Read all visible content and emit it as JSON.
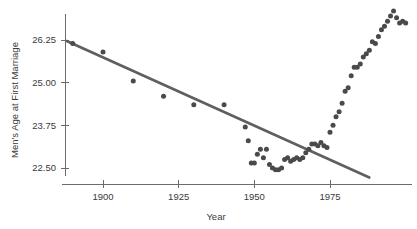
{
  "chart_data": {
    "type": "scatter",
    "title": "",
    "xlabel": "Year",
    "ylabel": "Men's Age at First Marriage",
    "xlim": [
      1885,
      2002
    ],
    "ylim": [
      22.1,
      27.2
    ],
    "grid": false,
    "legend": "none",
    "xticks": [
      1900,
      1925,
      1950,
      1975
    ],
    "xtick_labels": [
      "1900",
      "1925",
      "1950",
      "1975"
    ],
    "yticks": [
      22.5,
      23.75,
      25.0,
      26.25
    ],
    "ytick_labels": [
      "22.50",
      "23.75",
      "25.00",
      "26.25"
    ],
    "series": [
      {
        "name": "Men's median age at first marriage",
        "marker": "circle",
        "color": "#4a4a4a",
        "points": [
          [
            1890,
            26.15
          ],
          [
            1900,
            25.9
          ],
          [
            1910,
            25.05
          ],
          [
            1920,
            24.6
          ],
          [
            1930,
            24.35
          ],
          [
            1940,
            24.35
          ],
          [
            1947,
            23.7
          ],
          [
            1948,
            23.3
          ],
          [
            1949,
            22.65
          ],
          [
            1950,
            22.65
          ],
          [
            1951,
            22.9
          ],
          [
            1952,
            23.05
          ],
          [
            1953,
            22.8
          ],
          [
            1954,
            23.05
          ],
          [
            1955,
            22.6
          ],
          [
            1956,
            22.5
          ],
          [
            1957,
            22.45
          ],
          [
            1958,
            22.45
          ],
          [
            1959,
            22.5
          ],
          [
            1960,
            22.75
          ],
          [
            1961,
            22.8
          ],
          [
            1962,
            22.7
          ],
          [
            1963,
            22.75
          ],
          [
            1964,
            22.8
          ],
          [
            1965,
            22.75
          ],
          [
            1966,
            22.8
          ],
          [
            1967,
            22.95
          ],
          [
            1968,
            23.05
          ],
          [
            1969,
            23.2
          ],
          [
            1970,
            23.2
          ],
          [
            1971,
            23.15
          ],
          [
            1972,
            23.25
          ],
          [
            1973,
            23.15
          ],
          [
            1974,
            23.1
          ],
          [
            1975,
            23.55
          ],
          [
            1976,
            23.75
          ],
          [
            1977,
            24.0
          ],
          [
            1978,
            24.15
          ],
          [
            1979,
            24.4
          ],
          [
            1980,
            24.75
          ],
          [
            1981,
            24.85
          ],
          [
            1982,
            25.2
          ],
          [
            1983,
            25.45
          ],
          [
            1984,
            25.45
          ],
          [
            1985,
            25.55
          ],
          [
            1986,
            25.75
          ],
          [
            1987,
            25.85
          ],
          [
            1988,
            25.95
          ],
          [
            1989,
            26.2
          ],
          [
            1990,
            26.15
          ],
          [
            1991,
            26.35
          ],
          [
            1992,
            26.55
          ],
          [
            1993,
            26.65
          ],
          [
            1994,
            26.8
          ],
          [
            1995,
            26.95
          ],
          [
            1996,
            27.1
          ],
          [
            1997,
            26.9
          ],
          [
            1998,
            26.75
          ],
          [
            1999,
            26.8
          ],
          [
            2000,
            26.75
          ]
        ]
      }
    ],
    "annotations": [
      {
        "type": "trend-line",
        "label": "least-squares regression line",
        "color": "#5f5f5f",
        "x0": 1888,
        "y0": 26.22,
        "x1": 1988,
        "y1": 22.22
      }
    ]
  }
}
